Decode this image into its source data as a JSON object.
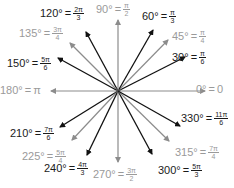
{
  "center": {
    "x": 118,
    "y": 91
  },
  "colors": {
    "primary": "#111111",
    "secondary": "#8c8c8c"
  },
  "angles": [
    {
      "deg": "0°",
      "rad_plain": "0",
      "num": "",
      "den": "",
      "group": "light",
      "end": [
        205,
        91
      ],
      "label": [
        196,
        84
      ]
    },
    {
      "deg": "30°",
      "num": "π",
      "den": "6",
      "group": "dark",
      "end": [
        185,
        57
      ],
      "label": [
        172,
        50
      ]
    },
    {
      "deg": "45°",
      "num": "π",
      "den": "4",
      "group": "light",
      "end": [
        168,
        40
      ],
      "label": [
        172,
        29
      ]
    },
    {
      "deg": "60°",
      "num": "π",
      "den": "3",
      "group": "dark",
      "end": [
        153,
        30
      ],
      "label": [
        142,
        9
      ]
    },
    {
      "deg": "90°",
      "num": "π",
      "den": "2",
      "group": "light",
      "end": [
        118,
        20
      ],
      "label": [
        96,
        2
      ]
    },
    {
      "deg": "120°",
      "num": "2π",
      "den": "3",
      "group": "dark",
      "end": [
        86,
        32
      ],
      "label": [
        40,
        6
      ]
    },
    {
      "deg": "135°",
      "num": "3π",
      "den": "4",
      "group": "light",
      "end": [
        70,
        43
      ],
      "label": [
        19,
        26
      ]
    },
    {
      "deg": "150°",
      "num": "5π",
      "den": "6",
      "group": "dark",
      "end": [
        58,
        58
      ],
      "label": [
        7,
        56
      ]
    },
    {
      "deg": "180°",
      "rad_plain": "π",
      "num": "",
      "den": "",
      "group": "light",
      "end": [
        51,
        91
      ],
      "label": [
        0,
        85
      ]
    },
    {
      "deg": "210°",
      "num": "7π",
      "den": "6",
      "group": "dark",
      "end": [
        60,
        127
      ],
      "label": [
        10,
        126
      ]
    },
    {
      "deg": "225°",
      "num": "5π",
      "den": "4",
      "group": "light",
      "end": [
        72,
        140
      ],
      "label": [
        22,
        149
      ]
    },
    {
      "deg": "240°",
      "num": "4π",
      "den": "3",
      "group": "dark",
      "end": [
        87,
        155
      ],
      "label": [
        44,
        161
      ]
    },
    {
      "deg": "270°",
      "num": "3π",
      "den": "2",
      "group": "light",
      "end": [
        118,
        162
      ],
      "label": [
        93,
        167
      ]
    },
    {
      "deg": "300°",
      "num": "5π",
      "den": "3",
      "group": "dark",
      "end": [
        152,
        154
      ],
      "label": [
        158,
        163
      ]
    },
    {
      "deg": "315°",
      "num": "7π",
      "den": "4",
      "group": "light",
      "end": [
        169,
        141
      ],
      "label": [
        175,
        145
      ]
    },
    {
      "deg": "330°",
      "num": "11π",
      "den": "6",
      "group": "dark",
      "end": [
        180,
        126
      ],
      "label": [
        181,
        111
      ]
    }
  ]
}
